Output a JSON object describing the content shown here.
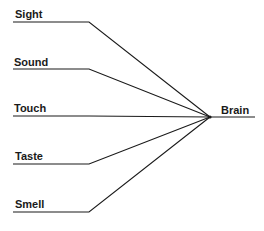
{
  "diagram": {
    "type": "convergence",
    "target": {
      "label": "Brain",
      "x": 210,
      "y": 117,
      "line_end_x": 255,
      "label_x": 221,
      "label_y": 104
    },
    "inputs": [
      {
        "label": "Sight",
        "y": 22,
        "line_start_x": 13,
        "bend_x": 89,
        "label_x": 15,
        "label_y": 8
      },
      {
        "label": "Sound",
        "y": 69,
        "line_start_x": 13,
        "bend_x": 89,
        "label_x": 14,
        "label_y": 56
      },
      {
        "label": "Touch",
        "y": 116,
        "line_start_x": 13,
        "bend_x": 89,
        "label_x": 14,
        "label_y": 102
      },
      {
        "label": "Taste",
        "y": 164,
        "line_start_x": 13,
        "bend_x": 89,
        "label_x": 15,
        "label_y": 150
      },
      {
        "label": "Smell",
        "y": 212,
        "line_start_x": 13,
        "bend_x": 89,
        "label_x": 15,
        "label_y": 198
      }
    ],
    "line_color": "#1a1a1a"
  }
}
